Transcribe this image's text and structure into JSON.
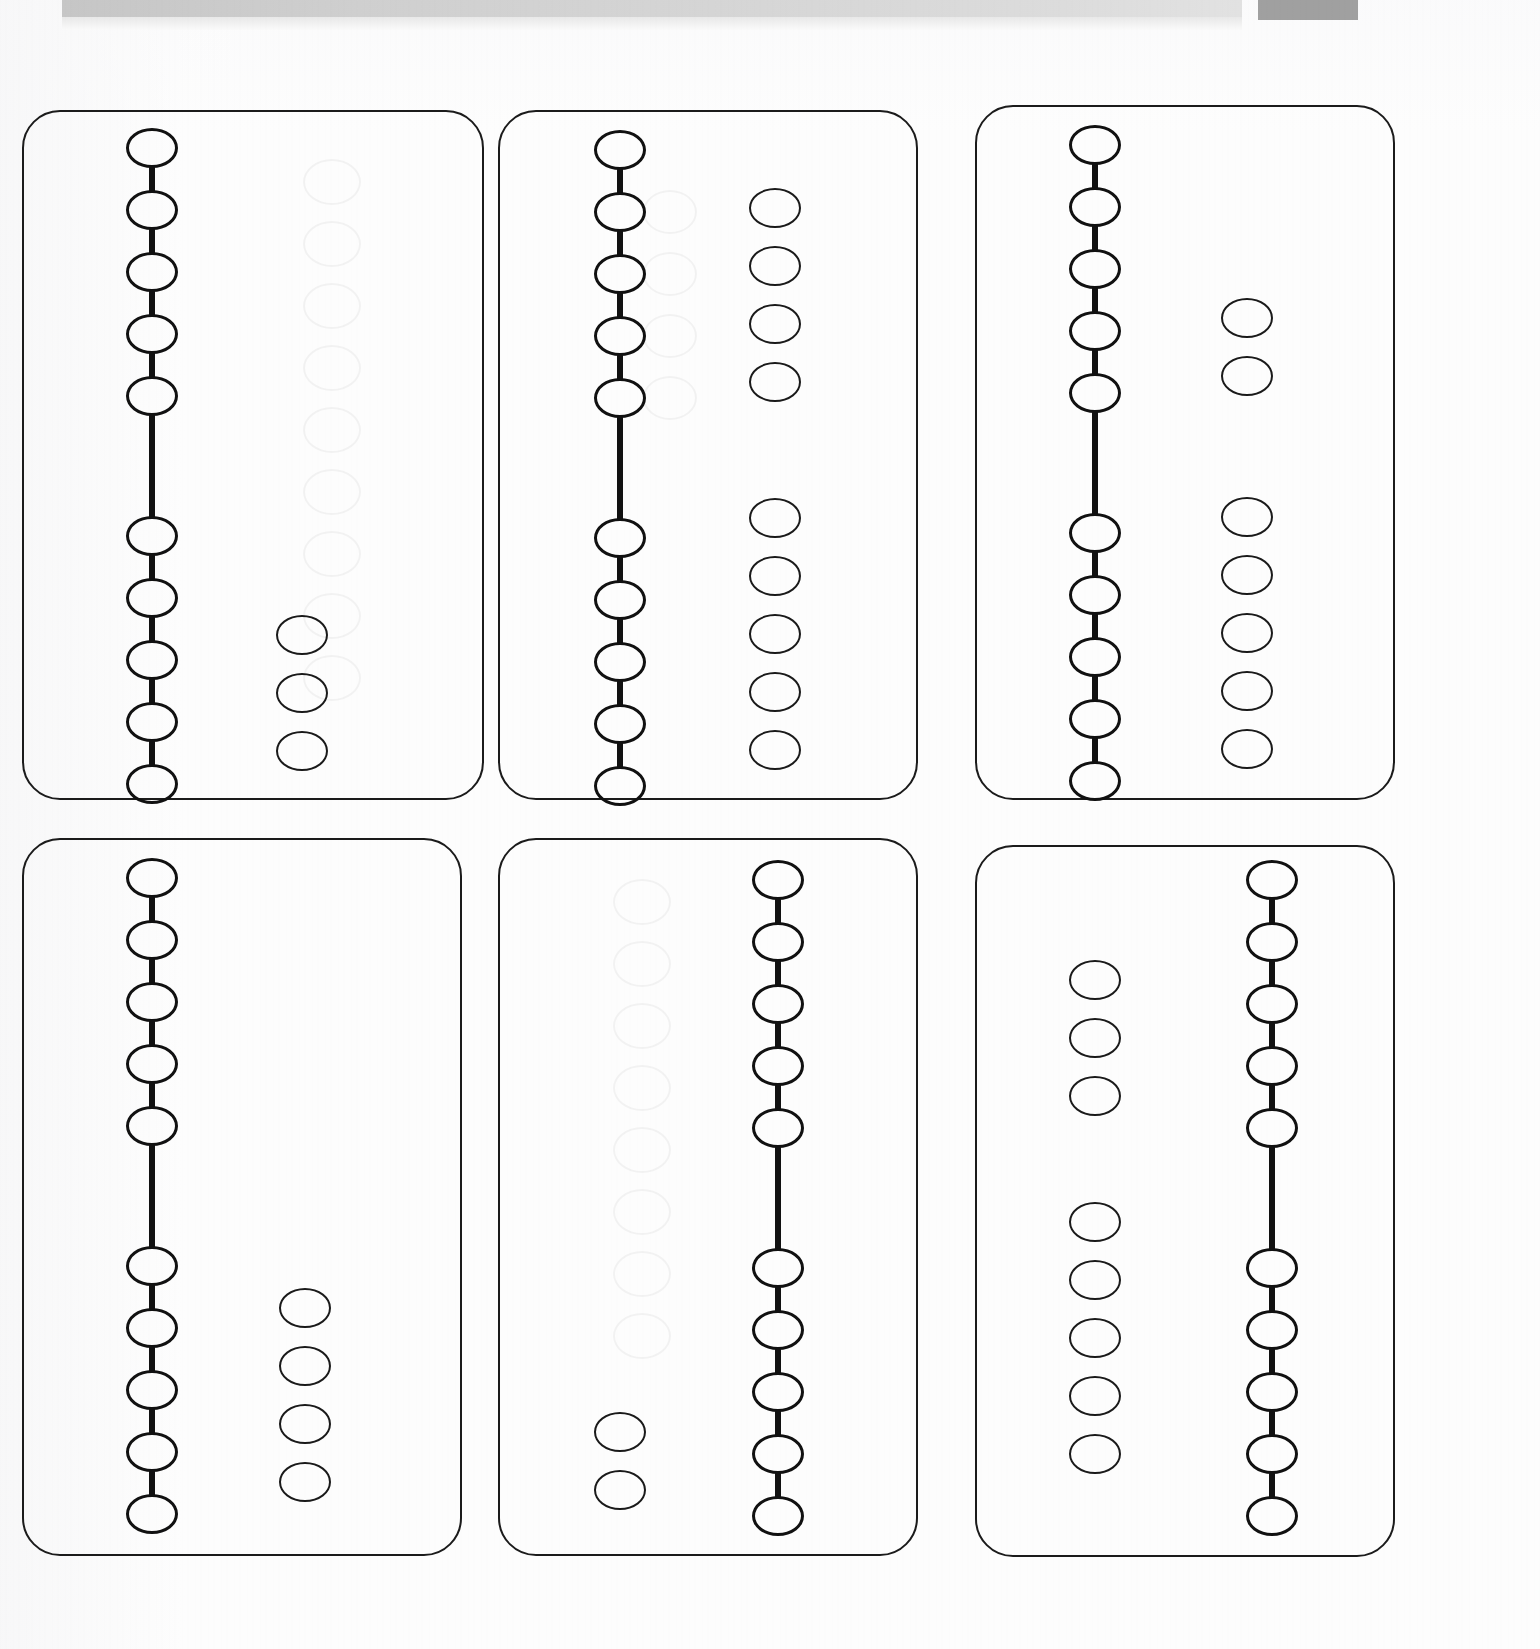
{
  "document": {
    "kind": "scanned-worksheet",
    "description": "Scanned worksheet page with six rounded-rectangle cards, each showing a connected bead chain of ten ovals plus a group of loose ovals",
    "page_width": 1540,
    "page_height": 1649,
    "background_color": "#fdfdfd",
    "ink_color": "#111111",
    "card_border_color": "#1b1b1b"
  },
  "scan_bar": {
    "label": "scanner-edge-bar",
    "main_color": "#d2d2d2",
    "dark_color": "#a0a0a0",
    "x": 62,
    "y": 0,
    "width": 1180,
    "height": 17,
    "dark_x": 1258,
    "dark_width": 100,
    "dark_height": 20
  },
  "geometry": {
    "bead_width": 52,
    "bead_height": 40,
    "chain_pitch": 62,
    "loose_pitch": 58,
    "chain_gap": 140,
    "card_radius": 38
  },
  "cards": [
    {
      "id": "card-1",
      "index": 1,
      "x": 22,
      "y": 110,
      "width": 462,
      "height": 690,
      "chain": {
        "side": "left",
        "cx": 152,
        "top_y": 148,
        "group_top_count": 5,
        "group_bottom_count": 5,
        "total_count": 10
      },
      "loose": {
        "side": "right",
        "cx": 302,
        "top_group_count": 0,
        "top_group_y": 0,
        "bottom_group_count": 3,
        "bottom_group_y": 635,
        "total_count": 3
      },
      "totals": {
        "chain_beads": 10,
        "loose_beads": 3,
        "all_beads": 13
      }
    },
    {
      "id": "card-2",
      "index": 2,
      "x": 498,
      "y": 110,
      "width": 420,
      "height": 690,
      "chain": {
        "side": "left",
        "cx": 620,
        "top_y": 150,
        "group_top_count": 5,
        "group_bottom_count": 5,
        "total_count": 10
      },
      "loose": {
        "side": "right",
        "cx": 775,
        "top_group_count": 4,
        "top_group_y": 208,
        "bottom_group_count": 5,
        "bottom_group_y": 518,
        "total_count": 9
      },
      "totals": {
        "chain_beads": 10,
        "loose_beads": 9,
        "all_beads": 19
      }
    },
    {
      "id": "card-3",
      "index": 3,
      "x": 975,
      "y": 105,
      "width": 420,
      "height": 695,
      "chain": {
        "side": "left",
        "cx": 1095,
        "top_y": 145,
        "group_top_count": 5,
        "group_bottom_count": 5,
        "total_count": 10
      },
      "loose": {
        "side": "right",
        "cx": 1247,
        "top_group_count": 2,
        "top_group_y": 318,
        "bottom_group_count": 5,
        "bottom_group_y": 517,
        "total_count": 7
      },
      "totals": {
        "chain_beads": 10,
        "loose_beads": 7,
        "all_beads": 17
      }
    },
    {
      "id": "card-4",
      "index": 4,
      "x": 22,
      "y": 838,
      "width": 440,
      "height": 718,
      "chain": {
        "side": "left",
        "cx": 152,
        "top_y": 878,
        "group_top_count": 5,
        "group_bottom_count": 5,
        "total_count": 10
      },
      "loose": {
        "side": "right",
        "cx": 305,
        "top_group_count": 0,
        "top_group_y": 0,
        "bottom_group_count": 4,
        "bottom_group_y": 1308,
        "total_count": 4
      },
      "totals": {
        "chain_beads": 10,
        "loose_beads": 4,
        "all_beads": 14
      }
    },
    {
      "id": "card-5",
      "index": 5,
      "x": 498,
      "y": 838,
      "width": 420,
      "height": 718,
      "chain": {
        "side": "right",
        "cx": 778,
        "top_y": 880,
        "group_top_count": 5,
        "group_bottom_count": 5,
        "total_count": 10
      },
      "loose": {
        "side": "left",
        "cx": 620,
        "top_group_count": 0,
        "top_group_y": 0,
        "bottom_group_count": 2,
        "bottom_group_y": 1432,
        "total_count": 2
      },
      "totals": {
        "chain_beads": 10,
        "loose_beads": 2,
        "all_beads": 12
      }
    },
    {
      "id": "card-6",
      "index": 6,
      "x": 975,
      "y": 845,
      "width": 420,
      "height": 712,
      "chain": {
        "side": "right",
        "cx": 1272,
        "top_y": 880,
        "group_top_count": 5,
        "group_bottom_count": 5,
        "total_count": 10
      },
      "loose": {
        "side": "left",
        "cx": 1095,
        "top_group_count": 3,
        "top_group_y": 980,
        "bottom_group_count": 5,
        "bottom_group_y": 1222,
        "total_count": 8
      },
      "totals": {
        "chain_beads": 10,
        "loose_beads": 8,
        "all_beads": 18
      }
    }
  ]
}
